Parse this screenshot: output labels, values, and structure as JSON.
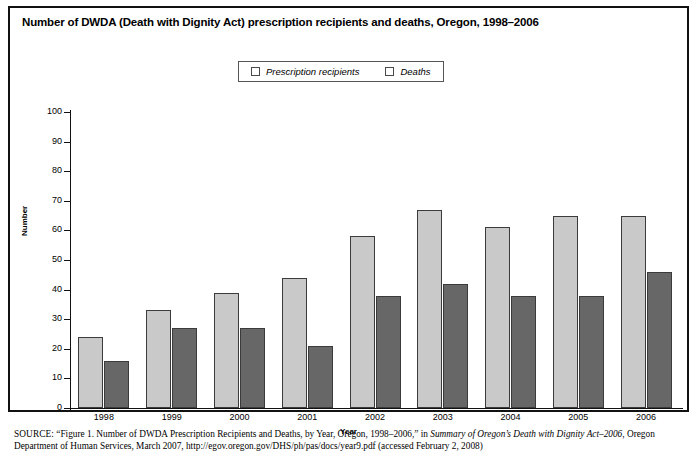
{
  "figure": {
    "title": "Number of DWDA (Death with Dignity Act) prescription recipients and deaths, Oregon, 1998–2006",
    "source_prefix": "SOURCE:",
    "source_part1": " “Figure 1. Number of DWDA Prescription Recipients and Deaths, by Year, Oregon, 1998–2006,” in ",
    "source_italic1": "Summary of Oregon’s Death with Dignity Act–2006",
    "source_part2": ", Oregon Department of Human Services, March 2007, http://egov.oregon.gov/DHS/ph/pas/docs/year9.pdf (accessed February 2, 2008)"
  },
  "legend": {
    "items": [
      {
        "label": "Prescription recipients",
        "color": "#c9c9c9",
        "swatch_name": "legend-swatch-recipients"
      },
      {
        "label": "Deaths",
        "color": "#676767",
        "swatch_name": "legend-swatch-deaths"
      }
    ]
  },
  "chart_data": {
    "type": "bar",
    "title": "Number of DWDA (Death with Dignity Act) prescription recipients and deaths, Oregon, 1998–2006",
    "xlabel": "Year",
    "ylabel": "Number",
    "ylim": [
      0,
      100
    ],
    "ytick_step": 10,
    "yticks": [
      0,
      10,
      20,
      30,
      40,
      50,
      60,
      70,
      80,
      90,
      100
    ],
    "grid": false,
    "legend_position": "top-center",
    "categories": [
      "1998",
      "1999",
      "2000",
      "2001",
      "2002",
      "2003",
      "2004",
      "2005",
      "2006"
    ],
    "series": [
      {
        "name": "Prescription recipients",
        "color": "#c9c9c9",
        "values": [
          24,
          33,
          39,
          44,
          58,
          67,
          61,
          65,
          65
        ]
      },
      {
        "name": "Deaths",
        "color": "#676767",
        "values": [
          16,
          27,
          27,
          21,
          38,
          42,
          38,
          38,
          46
        ]
      }
    ]
  }
}
